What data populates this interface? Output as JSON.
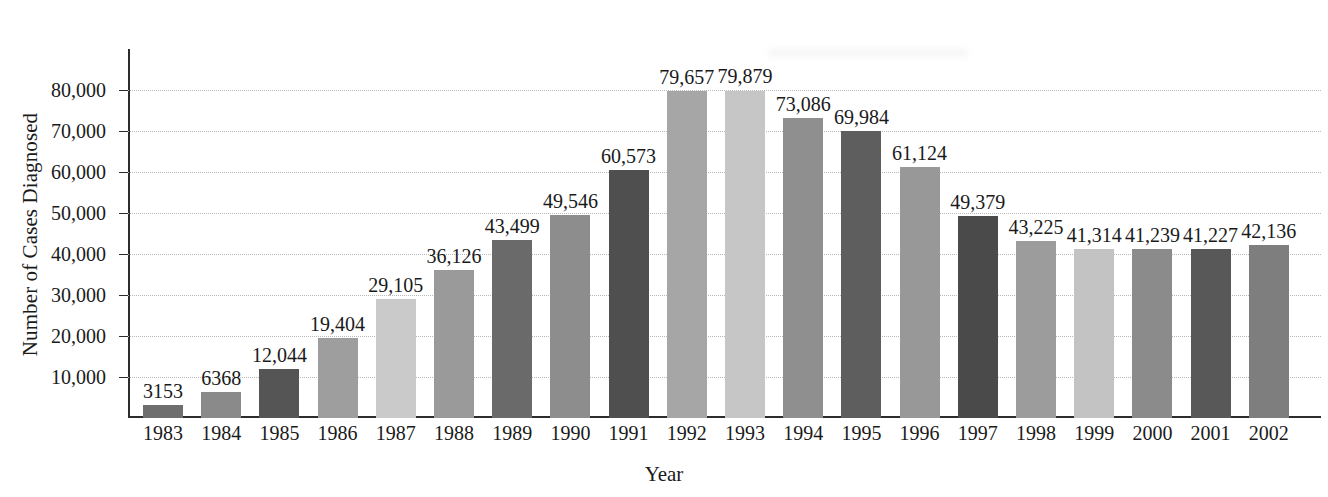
{
  "chart_data": {
    "type": "bar",
    "title": "",
    "xlabel": "Year",
    "ylabel": "Number of Cases Diagnosed",
    "categories": [
      "1983",
      "1984",
      "1985",
      "1986",
      "1987",
      "1988",
      "1989",
      "1990",
      "1991",
      "1992",
      "1993",
      "1994",
      "1995",
      "1996",
      "1997",
      "1998",
      "1999",
      "2000",
      "2001",
      "2002"
    ],
    "values": [
      3153,
      6368,
      12044,
      19404,
      29105,
      36126,
      43499,
      49546,
      60573,
      79657,
      79879,
      73086,
      69984,
      61124,
      49379,
      43225,
      41314,
      41239,
      41227,
      42136
    ],
    "value_labels": [
      "3153",
      "6368",
      "12,044",
      "19,404",
      "29,105",
      "36,126",
      "43,499",
      "49,546",
      "60,573",
      "79,657",
      "79,879",
      "73,086",
      "69,984",
      "61,124",
      "49,379",
      "43,225",
      "41,314",
      "41,239",
      "41,227",
      "42,136"
    ],
    "bar_colors": [
      "#6e6e6e",
      "#8a8a8a",
      "#555555",
      "#9e9e9e",
      "#cacaca",
      "#9a9a9a",
      "#6a6a6a",
      "#8d8d8d",
      "#4f4f4f",
      "#a6a6a6",
      "#c6c6c6",
      "#8f8f8f",
      "#5e5e5e",
      "#989898",
      "#4a4a4a",
      "#9c9c9c",
      "#c3c3c3",
      "#8b8b8b",
      "#585858",
      "#7e7e7e"
    ],
    "ylim": [
      0,
      80000
    ],
    "ytick_labels": [
      "10,000",
      "20,000",
      "30,000",
      "40,000",
      "50,000",
      "60,000",
      "70,000",
      "80,000"
    ],
    "ytick_values": [
      10000,
      20000,
      30000,
      40000,
      50000,
      60000,
      70000,
      80000
    ],
    "grid": true,
    "legend": "none",
    "axis_color": "#2c2c2c",
    "gridline_color": "#b9b9b9"
  }
}
